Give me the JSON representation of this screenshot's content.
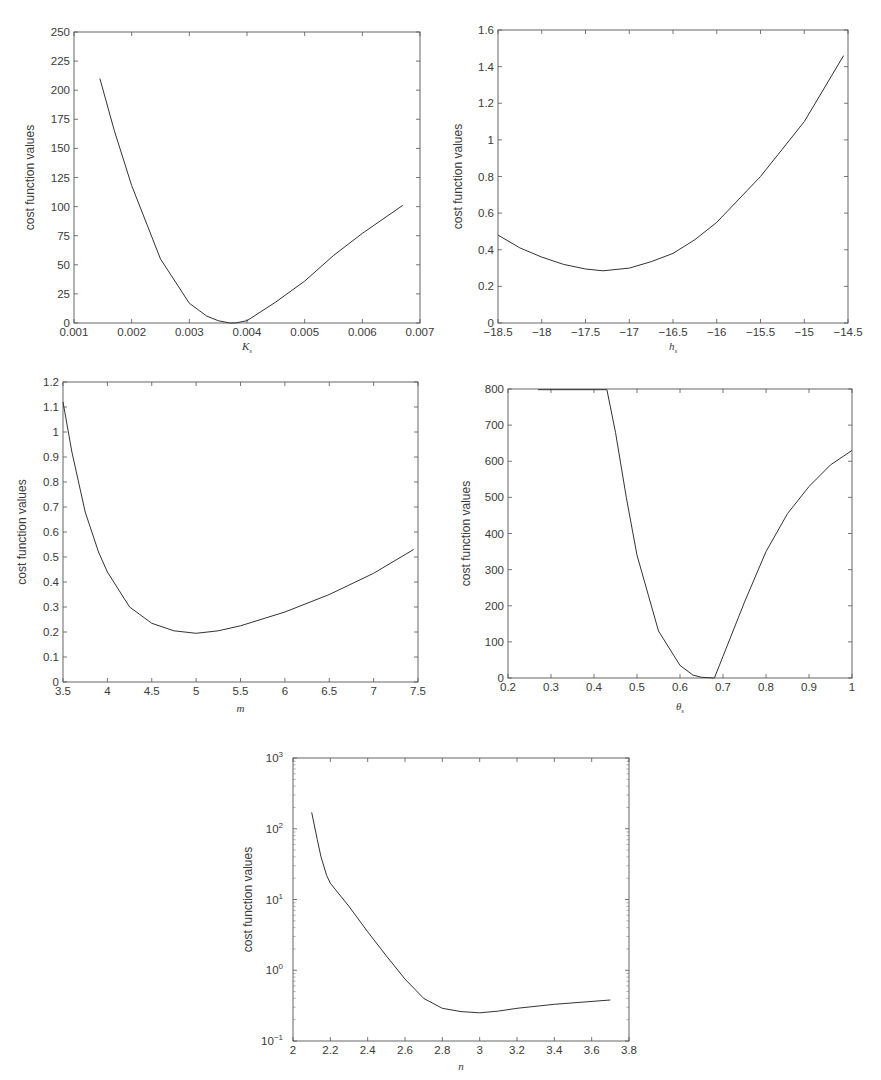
{
  "chart_data": [
    {
      "id": "ks",
      "type": "line",
      "title": "",
      "xlabel": "K_s",
      "xlabel_main": "K",
      "xlabel_sub": "s",
      "ylabel": "cost function values",
      "xlim": [
        0.001,
        0.007
      ],
      "ylim": [
        0,
        250
      ],
      "yscale": "linear",
      "grid": false,
      "xticks": [
        "0.001",
        "0.002",
        "0.003",
        "0.004",
        "0.005",
        "0.006",
        "0.007"
      ],
      "yticks": [
        "0",
        "25",
        "50",
        "75",
        "100",
        "125",
        "150",
        "175",
        "200",
        "225",
        "250"
      ],
      "x": [
        0.00145,
        0.0017,
        0.002,
        0.0025,
        0.003,
        0.0033,
        0.0035,
        0.0037,
        0.0038,
        0.004,
        0.0045,
        0.005,
        0.0055,
        0.006,
        0.0067
      ],
      "y": [
        210,
        165,
        118,
        55,
        17,
        6,
        2,
        0,
        0,
        2,
        18,
        36,
        58,
        77,
        101
      ]
    },
    {
      "id": "hs",
      "type": "line",
      "title": "",
      "xlabel": "h_s",
      "xlabel_main": "h",
      "xlabel_sub": "s",
      "ylabel": "cost function values",
      "xlim": [
        -18.5,
        -14.5
      ],
      "ylim": [
        0,
        1.6
      ],
      "yscale": "linear",
      "grid": false,
      "xticks": [
        "−18.5",
        "−18",
        "−17.5",
        "−17",
        "−16.5",
        "−16",
        "−15.5",
        "−15",
        "−14.5"
      ],
      "yticks": [
        "0",
        "0.2",
        "0.4",
        "0.6",
        "0.8",
        "1",
        "1.2",
        "1.4",
        "1.6"
      ],
      "x": [
        -18.5,
        -18.25,
        -18,
        -17.75,
        -17.5,
        -17.3,
        -17,
        -16.75,
        -16.5,
        -16.25,
        -16,
        -15.5,
        -15,
        -14.55
      ],
      "y": [
        0.48,
        0.41,
        0.36,
        0.32,
        0.295,
        0.285,
        0.3,
        0.335,
        0.38,
        0.455,
        0.55,
        0.8,
        1.1,
        1.46
      ]
    },
    {
      "id": "m",
      "type": "line",
      "title": "",
      "xlabel": "m",
      "xlabel_main": "m",
      "xlabel_sub": "",
      "ylabel": "cost function values",
      "xlim": [
        3.5,
        7.5
      ],
      "ylim": [
        0,
        1.2
      ],
      "yscale": "linear",
      "grid": false,
      "xticks": [
        "3.5",
        "4",
        "4.5",
        "5",
        "5.5",
        "6",
        "6.5",
        "7",
        "7.5"
      ],
      "yticks": [
        "0",
        "0.1",
        "0.2",
        "0.3",
        "0.4",
        "0.5",
        "0.6",
        "0.7",
        "0.8",
        "0.9",
        "1",
        "1.1",
        "1.2"
      ],
      "x": [
        3.5,
        3.6,
        3.75,
        3.9,
        4,
        4.25,
        4.5,
        4.75,
        5,
        5.25,
        5.5,
        6,
        6.5,
        7,
        7.45
      ],
      "y": [
        1.12,
        0.92,
        0.68,
        0.52,
        0.44,
        0.3,
        0.235,
        0.205,
        0.195,
        0.205,
        0.225,
        0.28,
        0.35,
        0.435,
        0.53
      ]
    },
    {
      "id": "thetas",
      "type": "line",
      "title": "",
      "xlabel": "θ_s",
      "xlabel_main": "θ",
      "xlabel_sub": "s",
      "ylabel": "cost function  values",
      "xlim": [
        0.2,
        1.0
      ],
      "ylim": [
        0,
        800
      ],
      "yscale": "linear",
      "grid": false,
      "xticks": [
        "0.2",
        "0.3",
        "0.4",
        "0.5",
        "0.6",
        "0.7",
        "0.8",
        "0.9",
        "1"
      ],
      "yticks": [
        "0",
        "100",
        "200",
        "300",
        "400",
        "500",
        "600",
        "700",
        "800"
      ],
      "x": [
        0.27,
        0.43,
        0.45,
        0.475,
        0.5,
        0.55,
        0.6,
        0.63,
        0.65,
        0.68,
        0.7,
        0.75,
        0.8,
        0.85,
        0.9,
        0.95,
        1.0
      ],
      "y": [
        798,
        798,
        680,
        500,
        340,
        130,
        35,
        8,
        2,
        0,
        60,
        210,
        350,
        455,
        530,
        590,
        630
      ]
    },
    {
      "id": "n",
      "type": "line",
      "title": "",
      "xlabel": "n",
      "xlabel_main": "n",
      "xlabel_sub": "",
      "ylabel": "cost function values",
      "xlim": [
        2,
        3.8
      ],
      "ylim": [
        0.1,
        1000
      ],
      "yscale": "log",
      "grid": false,
      "xticks": [
        "2",
        "2.2",
        "2.4",
        "2.6",
        "2.8",
        "3",
        "3.2",
        "3.4",
        "3.6",
        "3.8"
      ],
      "yticks": [
        "10^-1",
        "10^0",
        "10^1",
        "10^2",
        "10^3"
      ],
      "ytick_bases": [
        "10",
        "10",
        "10",
        "10",
        "10"
      ],
      "ytick_exps": [
        "−1",
        "0",
        "1",
        "2",
        "3"
      ],
      "x": [
        2.1,
        2.13,
        2.15,
        2.18,
        2.2,
        2.3,
        2.4,
        2.5,
        2.6,
        2.7,
        2.8,
        2.9,
        3.0,
        3.1,
        3.2,
        3.4,
        3.7
      ],
      "y": [
        170,
        70,
        40,
        22,
        17,
        8,
        3.5,
        1.6,
        0.75,
        0.4,
        0.29,
        0.26,
        0.25,
        0.265,
        0.29,
        0.33,
        0.38
      ]
    }
  ]
}
